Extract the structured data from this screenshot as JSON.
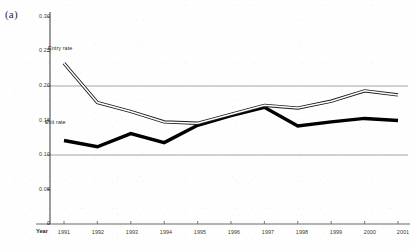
{
  "figure": {
    "panel_label": "(a)",
    "xaxis_title": "Year"
  },
  "axis": {
    "y_ticks": [
      "0.30",
      "0.25",
      "0.20",
      "0.15",
      "0.10",
      "0.05",
      "0"
    ],
    "x_ticks": [
      "1991",
      "1992",
      "1993",
      "1994",
      "1995",
      "1996",
      "1997",
      "1998",
      "1999",
      "2000",
      "2001"
    ]
  },
  "labels": {
    "entry": "Entry rate",
    "exit": "Exit rate"
  },
  "colors": {
    "entry_line": "#1a1a1a",
    "entry_fill": "#ffffff",
    "exit_line": "#000000",
    "gridline": "#9a9a9a",
    "axis": "#4a4a4a"
  },
  "chart_data": {
    "type": "line",
    "title": "",
    "xlabel": "Year",
    "ylabel": "",
    "xlim": [
      1991,
      2001
    ],
    "ylim": [
      0,
      0.3
    ],
    "grid": true,
    "gridlines_y": [
      0.1,
      0.2
    ],
    "legend": "inline-annotations",
    "categories": [
      1991,
      1992,
      1993,
      1994,
      1995,
      1996,
      1997,
      1998,
      1999,
      2000,
      2001
    ],
    "series": [
      {
        "name": "Entry rate",
        "style": "hollow-double-line",
        "values": [
          0.233,
          0.176,
          0.163,
          0.148,
          0.146,
          0.159,
          0.172,
          0.168,
          0.178,
          0.193,
          0.187
        ]
      },
      {
        "name": "Exit rate",
        "style": "thick-solid-line",
        "values": [
          0.121,
          0.112,
          0.131,
          0.118,
          0.143,
          0.157,
          0.169,
          0.142,
          0.148,
          0.153,
          0.15
        ]
      }
    ]
  }
}
